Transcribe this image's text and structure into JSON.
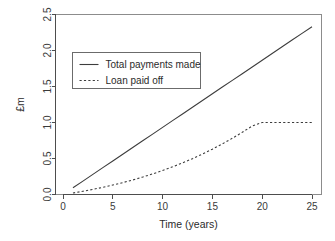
{
  "chart_data": {
    "type": "line",
    "title": "",
    "xlabel": "Time (years)",
    "ylabel": "£m",
    "xlim": [
      0,
      26
    ],
    "ylim": [
      0.0,
      2.5
    ],
    "grid": false,
    "legend_position": "top-left-inside",
    "x_ticks": [
      "0",
      "5",
      "10",
      "15",
      "20",
      "25"
    ],
    "x_tick_values": [
      0,
      5,
      10,
      15,
      20,
      25
    ],
    "y_ticks": [
      "0.0",
      "0.5",
      "1.0",
      "1.5",
      "2.0",
      "2.5"
    ],
    "y_tick_values": [
      0.0,
      0.5,
      1.0,
      1.5,
      2.0,
      2.5
    ],
    "x": [
      1,
      2,
      3,
      4,
      5,
      6,
      7,
      8,
      9,
      10,
      11,
      12,
      13,
      14,
      15,
      16,
      17,
      18,
      19,
      20,
      21,
      22,
      23,
      24,
      25
    ],
    "series": [
      {
        "name": "Total payments made",
        "style": "solid",
        "color": "#3d3d3d",
        "values": [
          0.093,
          0.186,
          0.28,
          0.373,
          0.466,
          0.559,
          0.653,
          0.746,
          0.839,
          0.932,
          1.026,
          1.119,
          1.212,
          1.305,
          1.399,
          1.492,
          1.585,
          1.678,
          1.772,
          1.865,
          1.958,
          2.051,
          2.145,
          2.238,
          2.331
        ]
      },
      {
        "name": "Loan paid off",
        "style": "dashed",
        "color": "#3d3d3d",
        "values": [
          0.021,
          0.045,
          0.071,
          0.1,
          0.131,
          0.165,
          0.202,
          0.242,
          0.286,
          0.333,
          0.384,
          0.439,
          0.498,
          0.562,
          0.63,
          0.703,
          0.781,
          0.864,
          0.952,
          1.0,
          1.0,
          1.0,
          1.0,
          1.0,
          1.0
        ]
      }
    ]
  },
  "legend": {
    "entries": [
      {
        "label": "Total payments made",
        "style": "solid"
      },
      {
        "label": "Loan paid off",
        "style": "dashed"
      }
    ]
  },
  "axes": {
    "x_title": "Time (years)",
    "y_title": "£m"
  }
}
